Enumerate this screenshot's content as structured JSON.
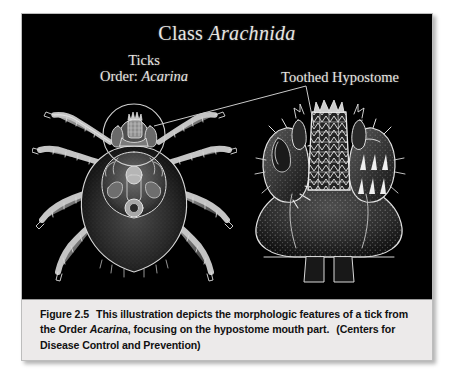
{
  "figure": {
    "plate": {
      "background_color": "#000000",
      "caption_band_color": "#eceaea"
    },
    "title": {
      "prefix": "Class ",
      "italic": "Arachnida"
    },
    "labels": {
      "ticks": {
        "line1": "Ticks",
        "line2_prefix": "Order: ",
        "line2_italic": "Acarina"
      },
      "hypostome": "Toothed Hypostome"
    },
    "illustrations": [
      {
        "name": "tick-dorsal-view",
        "description": "Dorsal view of a tick with eight legs and a circled capitulum"
      },
      {
        "name": "tick-capitulum-closeup",
        "description": "Close-up of tick mouthparts showing the toothed hypostome flanked by palps"
      }
    ],
    "leader_line": {
      "name": "hypostome-leader-line",
      "color": "#cfcfcf"
    },
    "caption": {
      "figure_number": "Figure 2.5",
      "text_1": "This illustration depicts the morphologic features of a tick from the Order ",
      "italic_term": "Acarina",
      "text_2": ", focusing on the hypostome mouth part.",
      "source": "(Centers for Disease Control and Prevention)"
    }
  }
}
